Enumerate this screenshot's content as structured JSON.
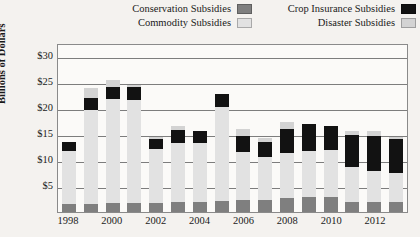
{
  "chart_data": {
    "type": "bar",
    "stacked": true,
    "title": "",
    "xlabel": "",
    "ylabel": "Billions of Dollars",
    "ylim": [
      0,
      32.5
    ],
    "yticks": [
      5,
      10,
      15,
      20,
      25,
      30
    ],
    "ytick_labels": [
      "$5",
      "$10",
      "$15",
      "$20",
      "$25",
      "$30"
    ],
    "grid": true,
    "legend_position": "top",
    "categories": [
      1998,
      1999,
      2000,
      2001,
      2002,
      2003,
      2004,
      2005,
      2006,
      2007,
      2008,
      2009,
      2010,
      2011,
      2012,
      2013
    ],
    "xtick_labels": [
      "1998",
      "2000",
      "2002",
      "2004",
      "2006",
      "2008",
      "2010",
      "2012"
    ],
    "series": [
      {
        "name": "Conservation Subsidies",
        "color": "#7f7f7f",
        "values": [
          1.6,
          1.5,
          1.8,
          1.7,
          1.8,
          1.9,
          2.0,
          2.2,
          2.4,
          2.4,
          2.6,
          2.8,
          2.9,
          2.0,
          1.9,
          1.9
        ]
      },
      {
        "name": "Commodity Subsidies",
        "color": "#e2e2e2",
        "values": [
          10.2,
          18.2,
          20.0,
          19.9,
          10.4,
          11.4,
          11.2,
          18.0,
          9.2,
          8.1,
          8.8,
          9.0,
          9.0,
          6.6,
          5.9,
          5.6
        ]
      },
      {
        "name": "Crop Insurance Subsidies",
        "color": "#121212",
        "values": [
          1.6,
          2.2,
          2.3,
          2.5,
          1.8,
          2.4,
          2.3,
          2.5,
          3.0,
          3.0,
          4.6,
          5.2,
          4.6,
          6.2,
          6.9,
          6.6
        ]
      },
      {
        "name": "Disaster Subsidies",
        "color": "#d3d3d3",
        "values": [
          0.0,
          1.9,
          1.2,
          0.3,
          0.5,
          0.9,
          0.0,
          0.0,
          1.4,
          0.8,
          1.4,
          0.0,
          0.0,
          0.8,
          0.8,
          0.4
        ]
      }
    ]
  },
  "legend": {
    "left_column": [
      {
        "label": "Conservation Subsidies",
        "color": "#7f7f7f"
      },
      {
        "label": "Commodity Subsidies",
        "color": "#e2e2e2"
      }
    ],
    "right_column": [
      {
        "label": "Crop Insurance Subsidies",
        "color": "#121212"
      },
      {
        "label": "Disaster Subsidies",
        "color": "#d3d3d3"
      }
    ]
  }
}
